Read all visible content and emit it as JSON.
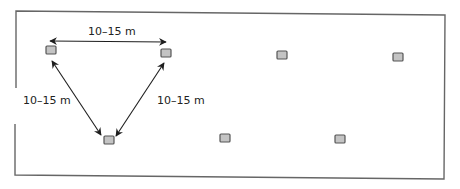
{
  "diagram": {
    "type": "spacing-layout",
    "colors": {
      "node_fill": "#c4c4c4",
      "node_stroke": "#555555",
      "border": "#666666",
      "arrow": "#1e1e1e",
      "text": "#222222"
    },
    "labels": {
      "top": "10–15 m",
      "left": "10–15 m",
      "right": "10–15 m"
    },
    "nodes": [
      {
        "id": "n1",
        "x": 51,
        "y": 51
      },
      {
        "id": "n2",
        "x": 166,
        "y": 53
      },
      {
        "id": "n3",
        "x": 108,
        "y": 136
      },
      {
        "id": "n4",
        "x": 281,
        "y": 54
      },
      {
        "id": "n5",
        "x": 397,
        "y": 56
      },
      {
        "id": "n6",
        "x": 224,
        "y": 137
      },
      {
        "id": "n7",
        "x": 339,
        "y": 138
      }
    ]
  }
}
